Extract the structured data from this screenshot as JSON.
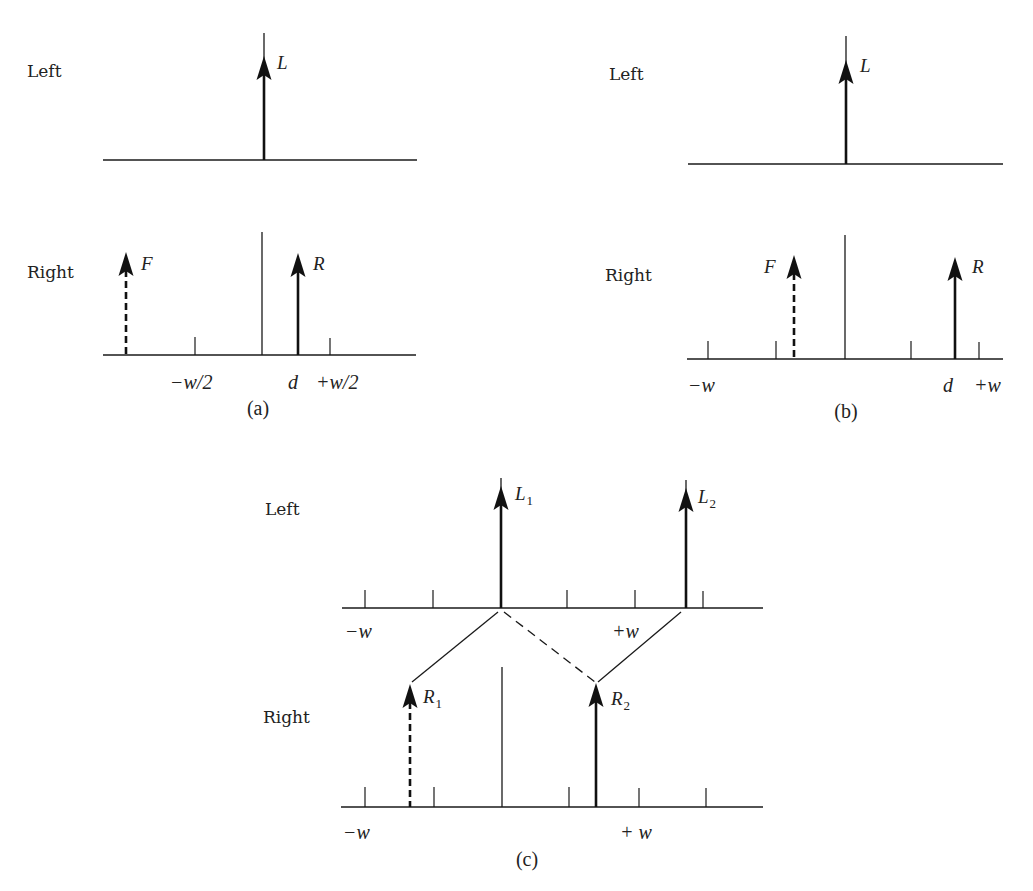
{
  "figure": {
    "colors": {
      "ink": "#111111",
      "background": "#ffffff"
    }
  },
  "panels": [
    {
      "id": "a",
      "caption": "(a)",
      "caption_pos": [
        258,
        415
      ],
      "rows": [
        {
          "name": "left",
          "label": "Left",
          "label_pos": [
            27,
            77
          ],
          "axis": {
            "x1": 103,
            "x2": 417,
            "y": 160
          },
          "center": null,
          "ticks": [],
          "arrows": [
            {
              "name": "L",
              "label": "L",
              "sub": "",
              "x": 264,
              "top": 33,
              "head_top": 56,
              "dashed": false,
              "label_pos": [
                277,
                69
              ]
            }
          ],
          "axis_labels": []
        },
        {
          "name": "right",
          "label": "Right",
          "label_pos": [
            27,
            278
          ],
          "axis": {
            "x1": 103,
            "x2": 416,
            "y": 355
          },
          "center": {
            "x": 262,
            "top": 232
          },
          "ticks": [
            {
              "x": 195,
              "top": 337
            },
            {
              "x": 330,
              "top": 338
            }
          ],
          "arrows": [
            {
              "name": "F",
              "label": "F",
              "sub": "",
              "x": 126,
              "top": 252,
              "head_top": 252,
              "dashed": true,
              "label_pos": [
                141,
                270
              ]
            },
            {
              "name": "R",
              "label": "R",
              "sub": "",
              "x": 298,
              "top": 253,
              "head_top": 253,
              "dashed": false,
              "label_pos": [
                313,
                270
              ]
            }
          ],
          "axis_labels": [
            {
              "text": "−w/2",
              "x": 170,
              "y": 389
            },
            {
              "text": "d",
              "x": 288,
              "y": 389
            },
            {
              "text": "+w/2",
              "x": 316,
              "y": 389
            }
          ]
        }
      ]
    },
    {
      "id": "b",
      "caption": "(b)",
      "caption_pos": [
        846,
        418
      ],
      "rows": [
        {
          "name": "left",
          "label": "Left",
          "label_pos": [
            609,
            80
          ],
          "axis": {
            "x1": 688,
            "x2": 1003,
            "y": 164
          },
          "center": null,
          "ticks": [],
          "arrows": [
            {
              "name": "L",
              "label": "L",
              "sub": "",
              "x": 846,
              "top": 36,
              "head_top": 60,
              "dashed": false,
              "label_pos": [
                860,
                72
              ]
            }
          ],
          "axis_labels": []
        },
        {
          "name": "right",
          "label": "Right",
          "label_pos": [
            605,
            281
          ],
          "axis": {
            "x1": 687,
            "x2": 1003,
            "y": 359
          },
          "center": {
            "x": 845,
            "top": 235
          },
          "ticks": [
            {
              "x": 708,
              "top": 341
            },
            {
              "x": 776,
              "top": 341
            },
            {
              "x": 911,
              "top": 341
            },
            {
              "x": 979,
              "top": 342
            }
          ],
          "arrows": [
            {
              "name": "F",
              "label": "F",
              "sub": "",
              "x": 794,
              "top": 255,
              "head_top": 255,
              "dashed": true,
              "label_pos": [
                764,
                273
              ]
            },
            {
              "name": "R",
              "label": "R",
              "sub": "",
              "x": 955,
              "top": 257,
              "head_top": 257,
              "dashed": false,
              "label_pos": [
                972,
                273
              ]
            }
          ],
          "axis_labels": [
            {
              "text": "−w",
              "x": 688,
              "y": 392
            },
            {
              "text": "d",
              "x": 943,
              "y": 392
            },
            {
              "text": "+w",
              "x": 974,
              "y": 392
            }
          ]
        }
      ]
    },
    {
      "id": "c",
      "caption": "(c)",
      "caption_pos": [
        527,
        866
      ],
      "rows": [
        {
          "name": "left",
          "label": "Left",
          "label_pos": [
            265,
            515
          ],
          "axis": {
            "x1": 342,
            "x2": 763,
            "y": 608
          },
          "center": null,
          "ticks": [
            {
              "x": 365,
              "top": 590
            },
            {
              "x": 433,
              "top": 590
            },
            {
              "x": 567,
              "top": 590
            },
            {
              "x": 635,
              "top": 590
            },
            {
              "x": 703,
              "top": 591
            }
          ],
          "arrows": [
            {
              "name": "L1",
              "label": "L",
              "sub": "1",
              "x": 501,
              "top": 478,
              "head_top": 486,
              "dashed": false,
              "label_pos": [
                515,
                500
              ]
            },
            {
              "name": "L2",
              "label": "L",
              "sub": "2",
              "x": 686,
              "top": 480,
              "head_top": 488,
              "dashed": false,
              "label_pos": [
                698,
                503
              ]
            }
          ],
          "axis_labels": [
            {
              "text": "−w",
              "x": 345,
              "y": 638
            },
            {
              "text": "+w",
              "x": 612,
              "y": 638
            }
          ]
        },
        {
          "name": "right",
          "label": "Right",
          "label_pos": [
            263,
            723
          ],
          "axis": {
            "x1": 341,
            "x2": 763,
            "y": 807
          },
          "center": {
            "x": 502,
            "top": 667
          },
          "ticks": [
            {
              "x": 365,
              "top": 787
            },
            {
              "x": 434,
              "top": 787
            },
            {
              "x": 569,
              "top": 787
            },
            {
              "x": 639,
              "top": 788
            },
            {
              "x": 706,
              "top": 788
            }
          ],
          "arrows": [
            {
              "name": "R1",
              "label": "R",
              "sub": "1",
              "x": 410,
              "top": 684,
              "head_top": 684,
              "dashed": true,
              "label_pos": [
                423,
                703
              ]
            },
            {
              "name": "R2",
              "label": "R",
              "sub": "2",
              "x": 596,
              "top": 683,
              "head_top": 683,
              "dashed": false,
              "label_pos": [
                611,
                705
              ]
            }
          ],
          "axis_labels": [
            {
              "text": "−w",
              "x": 343,
              "y": 839
            },
            {
              "text": "+ w",
              "x": 620,
              "y": 839
            }
          ]
        }
      ],
      "connections": [
        {
          "name": "L1-to-R1",
          "from": [
            498,
            612
          ],
          "to": [
            412,
            682
          ],
          "dashed": false
        },
        {
          "name": "L1-to-R2",
          "from": [
            504,
            612
          ],
          "to": [
            595,
            682
          ],
          "dashed": true
        },
        {
          "name": "L2-to-R2",
          "from": [
            681,
            612
          ],
          "to": [
            598,
            682
          ],
          "dashed": false
        }
      ]
    }
  ]
}
